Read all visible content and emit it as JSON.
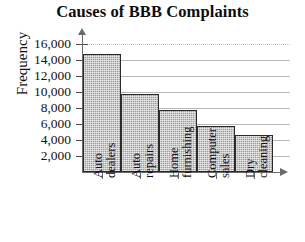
{
  "chart_data": {
    "type": "bar",
    "title": "Causes of BBB Complaints",
    "xlabel": "",
    "ylabel": "Frequency",
    "categories": [
      "Auto dealers",
      "Auto repairs",
      "Home furnishing",
      "Computer sales",
      "Dry cleaning"
    ],
    "category_lines": [
      {
        "line1": "Auto",
        "line2": "dealers"
      },
      {
        "line1": "Auto",
        "line2": "repairs"
      },
      {
        "line1": "Home",
        "line2": "furnishing"
      },
      {
        "line1": "Computer",
        "line2": "sales"
      },
      {
        "line1": "Dry",
        "line2": "cleaning"
      }
    ],
    "values": [
      14700,
      9700,
      7700,
      5700,
      4600
    ],
    "ylim": [
      0,
      16000
    ],
    "ytick_labels": [
      "16,000",
      "14,000",
      "12,000",
      "10,000",
      "8,000",
      "6,000",
      "4,000",
      "2,000"
    ],
    "ytick_values": [
      16000,
      14000,
      12000,
      10000,
      8000,
      6000,
      4000,
      2000
    ],
    "grid": true,
    "legend": false,
    "colors": {
      "bar_fill": "#9d9d9d",
      "bar_border": "#2a2a2a",
      "gridline": "#b9b9b9",
      "axis": "#6a6a6a",
      "text": "#111111",
      "background": "#ffffff"
    }
  }
}
